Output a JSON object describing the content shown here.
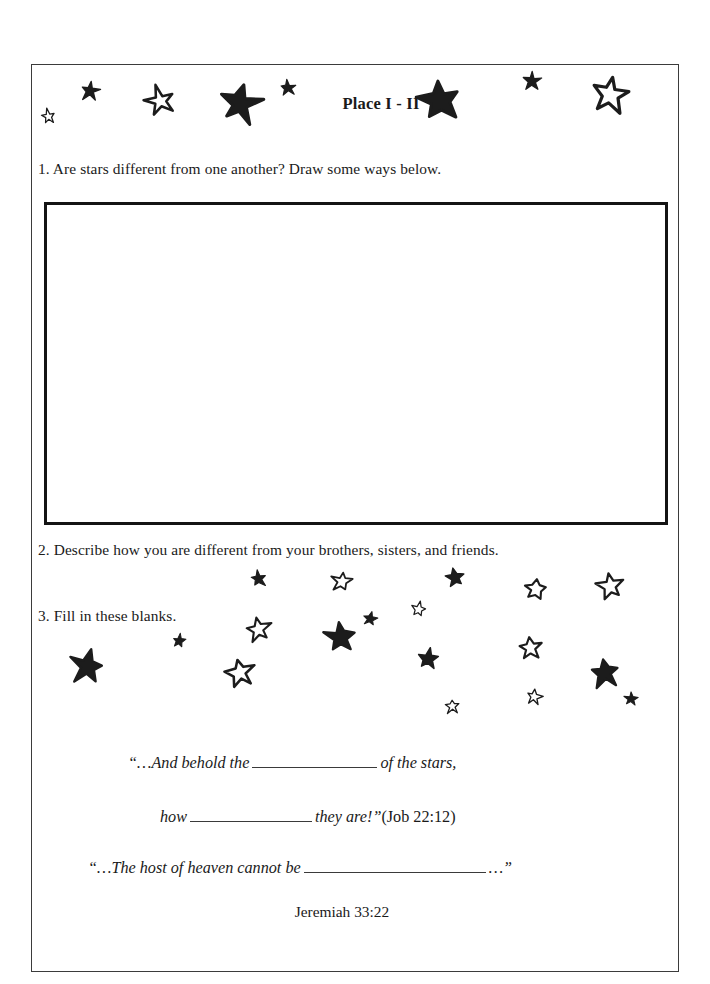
{
  "page": {
    "title": "Place I - II"
  },
  "questions": [
    {
      "id": "q1",
      "text": "1. Are stars different from one another? Draw some ways below."
    },
    {
      "id": "q2",
      "text": "2. Describe how you are different from your brothers, sisters, and friends."
    },
    {
      "id": "q3",
      "text": "3. Fill in these blanks."
    }
  ],
  "drawing_area": {
    "label": "drawing-answer-box",
    "content": ""
  },
  "scripture": {
    "line1_before": "“…And behold the",
    "line1_after": "of the stars,",
    "line2_before": "how",
    "line2_after": "they are!”",
    "line2_citation": "(Job 22:12)",
    "line3_before": "“…The host of heaven cannot be",
    "line3_after": "…”",
    "reference": "Jeremiah 33:22"
  },
  "colors": {
    "ink": "#1a1a1a",
    "star_fill": "#1c1c1c",
    "star_outline": "#1c1c1c",
    "page_border": "#3b3b3b",
    "box_border": "#141414",
    "paper": "#ffffff"
  },
  "stars": {
    "header": [
      {
        "name": "star-outline-small-1",
        "x": 48,
        "y": 116,
        "size": 15,
        "fill": false,
        "rot": -8
      },
      {
        "name": "star-filled-small-1",
        "x": 90,
        "y": 91,
        "size": 20,
        "fill": true,
        "rot": 6
      },
      {
        "name": "star-outline-med-1",
        "x": 160,
        "y": 101,
        "size": 30,
        "fill": false,
        "rot": -12
      },
      {
        "name": "star-filled-large-1",
        "x": 240,
        "y": 104,
        "size": 42,
        "fill": true,
        "rot": 10
      },
      {
        "name": "star-filled-tiny-1",
        "x": 288,
        "y": 88,
        "size": 16,
        "fill": true,
        "rot": -5
      },
      {
        "name": "star-filled-large-2",
        "x": 440,
        "y": 100,
        "size": 42,
        "fill": true,
        "rot": -8
      },
      {
        "name": "star-filled-small-2",
        "x": 532,
        "y": 81,
        "size": 18,
        "fill": true,
        "rot": 4
      },
      {
        "name": "star-outline-large-1",
        "x": 610,
        "y": 94,
        "size": 38,
        "fill": false,
        "rot": 7
      }
    ],
    "field": [
      {
        "name": "star-filled-tiny-2",
        "x": 258,
        "y": 578,
        "size": 17,
        "fill": true,
        "rot": -6
      },
      {
        "name": "star-outline-small-2",
        "x": 341,
        "y": 581,
        "size": 21,
        "fill": false,
        "rot": 8
      },
      {
        "name": "star-filled-small-3",
        "x": 455,
        "y": 578,
        "size": 20,
        "fill": true,
        "rot": -10
      },
      {
        "name": "star-outline-small-3",
        "x": 535,
        "y": 589,
        "size": 25,
        "fill": false,
        "rot": 5
      },
      {
        "name": "star-outline-med-2",
        "x": 610,
        "y": 586,
        "size": 27,
        "fill": false,
        "rot": -7
      },
      {
        "name": "star-outline-tiny-1",
        "x": 418,
        "y": 609,
        "size": 15,
        "fill": false,
        "rot": 9
      },
      {
        "name": "star-outline-small-4",
        "x": 258,
        "y": 629,
        "size": 25,
        "fill": false,
        "rot": -9
      },
      {
        "name": "star-filled-tiny-3",
        "x": 179,
        "y": 641,
        "size": 14,
        "fill": true,
        "rot": 6
      },
      {
        "name": "star-filled-med-1",
        "x": 340,
        "y": 637,
        "size": 33,
        "fill": true,
        "rot": -5
      },
      {
        "name": "star-filled-tiny-4",
        "x": 370,
        "y": 619,
        "size": 14,
        "fill": true,
        "rot": 11
      },
      {
        "name": "star-outline-small-5",
        "x": 530,
        "y": 648,
        "size": 25,
        "fill": false,
        "rot": -6
      },
      {
        "name": "star-filled-med-2",
        "x": 87,
        "y": 667,
        "size": 34,
        "fill": true,
        "rot": 9
      },
      {
        "name": "star-outline-med-3",
        "x": 240,
        "y": 673,
        "size": 30,
        "fill": false,
        "rot": -11
      },
      {
        "name": "star-filled-small-4",
        "x": 428,
        "y": 659,
        "size": 22,
        "fill": true,
        "rot": 7
      },
      {
        "name": "star-filled-med-3",
        "x": 605,
        "y": 673,
        "size": 32,
        "fill": true,
        "rot": -8
      },
      {
        "name": "star-filled-tiny-5",
        "x": 631,
        "y": 699,
        "size": 14,
        "fill": true,
        "rot": 5
      },
      {
        "name": "star-outline-tiny-2",
        "x": 452,
        "y": 706,
        "size": 15,
        "fill": false,
        "rot": -4
      },
      {
        "name": "star-outline-tiny-3",
        "x": 534,
        "y": 697,
        "size": 16,
        "fill": false,
        "rot": 10
      }
    ]
  }
}
